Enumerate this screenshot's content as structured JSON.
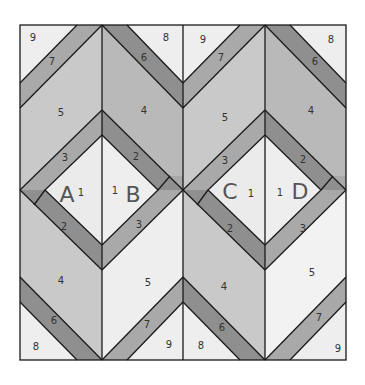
{
  "diagram": {
    "title": "",
    "colors": {
      "background": "#ffffff",
      "piece_light": "#eeeeee",
      "piece_center": "#ebebeb",
      "piece_medium": "#c9c9c9",
      "piece_medium_dark": "#b9b9b9",
      "strip_light": "#a9a9a9",
      "strip_dark": "#8f8f8f",
      "outline": "#1a1a1a"
    },
    "sections": [
      {
        "letter": "A",
        "center_number": "1",
        "pieces": {
          "p2": "2",
          "p3": "3",
          "p4": "4",
          "p5": "5",
          "p6": "6",
          "p7": "7",
          "p8": "8",
          "p9": "9"
        }
      },
      {
        "letter": "B",
        "center_number": "1",
        "pieces": {
          "p2": "2",
          "p3": "3",
          "p4": "4",
          "p5": "5",
          "p6": "6",
          "p7": "7",
          "p8": "8",
          "p9": "9"
        }
      },
      {
        "letter": "C",
        "center_number": "1",
        "pieces": {
          "p2": "2",
          "p3": "3",
          "p4": "4",
          "p5": "5",
          "p6": "6",
          "p7": "7",
          "p8": "8",
          "p9": "9"
        }
      },
      {
        "letter": "D",
        "center_number": "1",
        "pieces": {
          "p2": "2",
          "p3": "3",
          "p4": "4",
          "p5": "5",
          "p6": "6",
          "p7": "7",
          "p8": "8",
          "p9": "9"
        }
      }
    ]
  }
}
